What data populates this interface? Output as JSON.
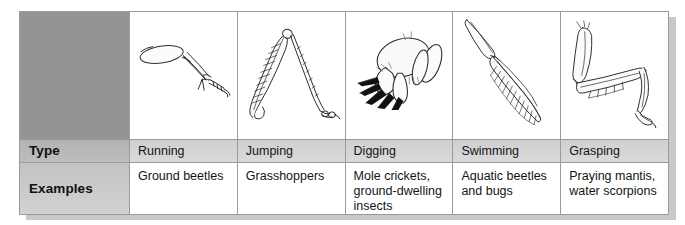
{
  "figure": {
    "colors": {
      "table_border": "#9a9a9a",
      "label_blank_fill": "#949494",
      "label_row_fill": "#bdbdbd",
      "type_row_fill": "#d4d4d4",
      "examples_row_fill": "#ffffff",
      "page_shadow": "#c9c9c9",
      "ink": "#141414"
    }
  },
  "table": {
    "row_labels": {
      "blank": "",
      "type": "Type",
      "examples": "Examples"
    },
    "columns": [
      {
        "illustration": "running-leg-illustration",
        "type": "Running",
        "examples": "Ground beetles"
      },
      {
        "illustration": "jumping-leg-illustration",
        "type": "Jumping",
        "examples": "Grasshoppers"
      },
      {
        "illustration": "digging-leg-illustration",
        "type": "Digging",
        "examples": "Mole crickets, ground-dwelling insects"
      },
      {
        "illustration": "swimming-leg-illustration",
        "type": "Swimming",
        "examples": "Aquatic beetles and bugs"
      },
      {
        "illustration": "grasping-leg-illustration",
        "type": "Grasping",
        "examples": "Praying mantis, water scorpions"
      }
    ]
  }
}
